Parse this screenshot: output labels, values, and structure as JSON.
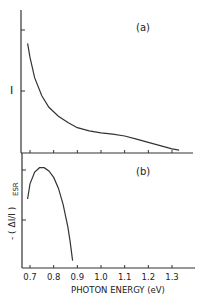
{
  "chart_data": [
    {
      "panel": "(a)",
      "type": "line",
      "title": "",
      "xlabel": "",
      "ylabel": "I",
      "xlim": [
        0.67,
        1.37
      ],
      "yticks_unlabeled": 2,
      "grid": false,
      "series": [
        {
          "name": "I",
          "x": [
            0.69,
            0.7,
            0.72,
            0.75,
            0.78,
            0.82,
            0.86,
            0.9,
            0.95,
            1.0,
            1.05,
            1.1,
            1.15,
            1.2,
            1.25,
            1.3,
            1.33
          ],
          "y": [
            0.85,
            0.74,
            0.58,
            0.44,
            0.35,
            0.28,
            0.23,
            0.19,
            0.165,
            0.15,
            0.14,
            0.125,
            0.1,
            0.075,
            0.05,
            0.025,
            0.015
          ]
        }
      ]
    },
    {
      "panel": "(b)",
      "type": "line",
      "title": "",
      "xlabel": "PHOTON ENERGY (eV)",
      "ylabel": "-(ΔI/I)ESR",
      "xlim": [
        0.67,
        1.37
      ],
      "xticks": [
        0.7,
        0.8,
        0.9,
        1.0,
        1.1,
        1.2,
        1.3
      ],
      "grid": false,
      "series": [
        {
          "name": "-(ΔI/I)ESR",
          "x": [
            0.69,
            0.7,
            0.72,
            0.74,
            0.76,
            0.78,
            0.8,
            0.82,
            0.84,
            0.86,
            0.87,
            0.88
          ],
          "y": [
            0.62,
            0.76,
            0.87,
            0.91,
            0.91,
            0.88,
            0.82,
            0.72,
            0.57,
            0.36,
            0.22,
            0.05
          ]
        }
      ]
    }
  ],
  "panels": {
    "a_label": "(a)",
    "b_label": "(b)"
  },
  "axes": {
    "a_ylabel": "I",
    "b_ylabel_main": "- ( ΔI/I )",
    "b_ylabel_sub": "ESR",
    "xlabel": "PHOTON ENERGY (eV)",
    "xtick_labels": [
      "0.7",
      "0.8",
      "0.9",
      "1.0",
      "1.1",
      "1.2",
      "1.3"
    ]
  }
}
